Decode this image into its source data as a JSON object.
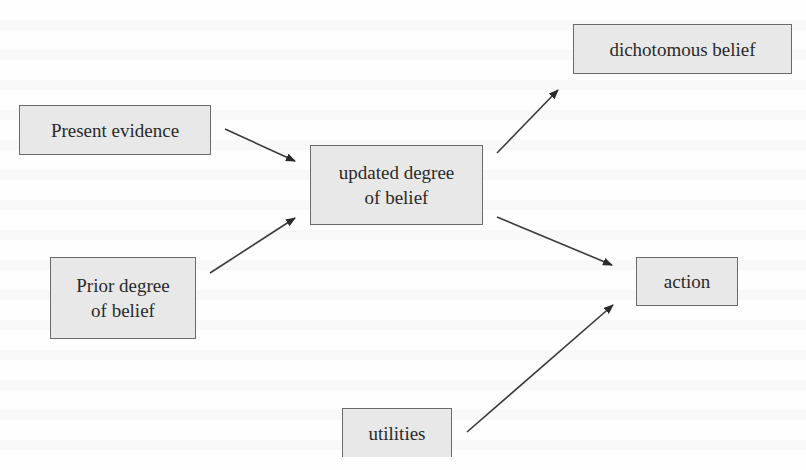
{
  "diagram": {
    "colors": {
      "box_fill": "#e8e8e8",
      "box_border": "#6a6a6a",
      "text": "#2a2a2a",
      "arrow": "#3a3a3a",
      "background": "#fefefe"
    },
    "nodes": {
      "present_evidence": {
        "label": "Present evidence"
      },
      "prior_degree": {
        "line1": "Prior degree",
        "line2": "of belief"
      },
      "updated_degree": {
        "line1": "updated degree",
        "line2": "of belief"
      },
      "dichotomous_belief": {
        "label": "dichotomous belief"
      },
      "action": {
        "label": "action"
      },
      "utilities": {
        "label": "utilities"
      }
    },
    "edges": [
      {
        "from": "Present evidence",
        "to": "updated degree of belief"
      },
      {
        "from": "Prior degree of belief",
        "to": "updated degree of belief"
      },
      {
        "from": "updated degree of belief",
        "to": "dichotomous belief"
      },
      {
        "from": "updated degree of belief",
        "to": "action"
      },
      {
        "from": "utilities",
        "to": "action"
      }
    ]
  }
}
